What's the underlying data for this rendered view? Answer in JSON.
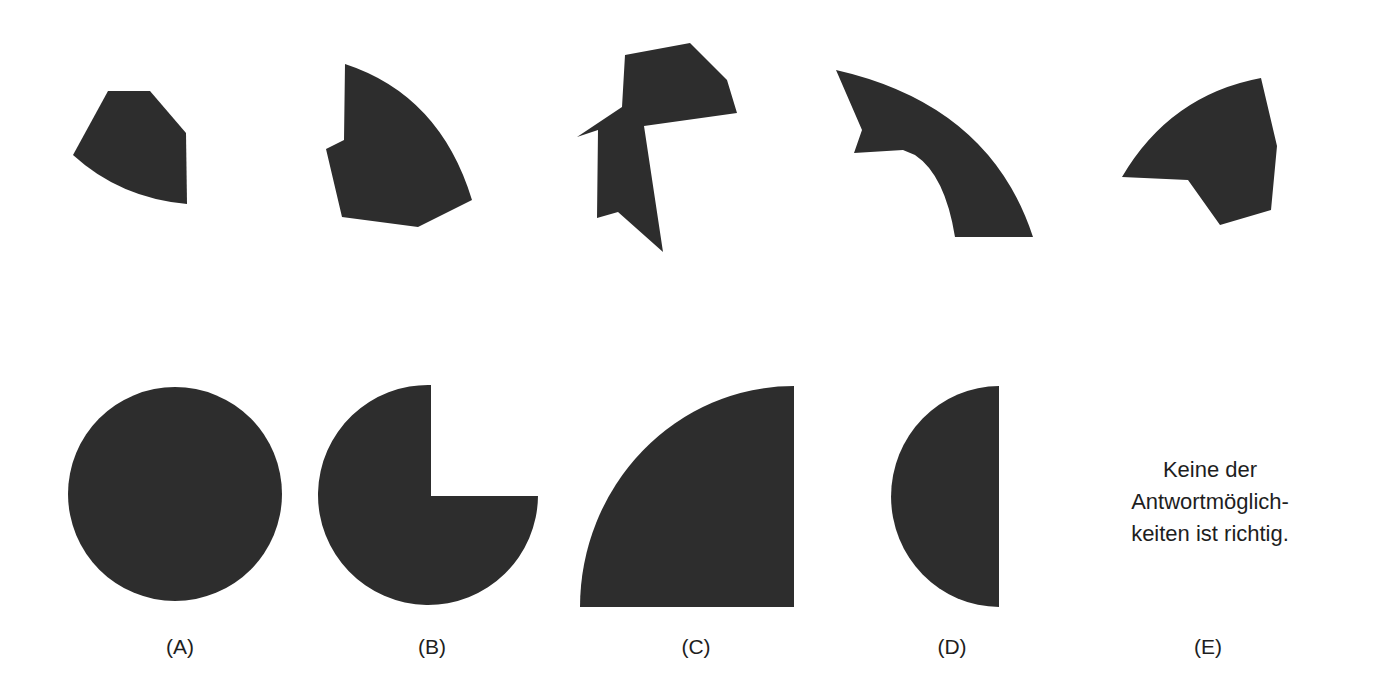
{
  "task": {
    "pieces_row": {
      "pieces": [
        {
          "id": "piece-1",
          "shape": "polygon-with-arc"
        },
        {
          "id": "piece-2",
          "shape": "polygon-with-arc"
        },
        {
          "id": "piece-3",
          "shape": "polygon"
        },
        {
          "id": "piece-4",
          "shape": "arc-band"
        },
        {
          "id": "piece-5",
          "shape": "polygon-with-arc"
        }
      ]
    },
    "answers_row": {
      "options": [
        {
          "label": "(A)",
          "shape": "full-circle"
        },
        {
          "label": "(B)",
          "shape": "three-quarter-circle"
        },
        {
          "label": "(C)",
          "shape": "quarter-circle"
        },
        {
          "label": "(D)",
          "shape": "half-circle"
        },
        {
          "label": "(E)",
          "shape": "text",
          "text_lines": [
            "Keine der",
            "Antwortmöglich-",
            "keiten ist richtig."
          ]
        }
      ]
    }
  },
  "colors": {
    "shape_fill": "#2d2d2d",
    "background": "#ffffff",
    "text": "#1e1e1e"
  }
}
